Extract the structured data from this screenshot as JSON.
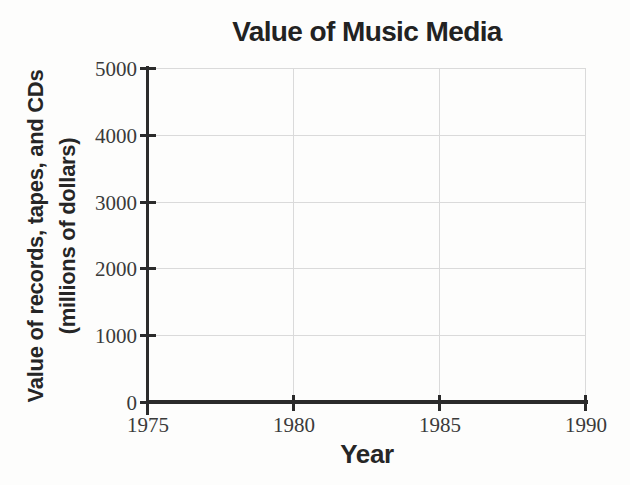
{
  "chart_data": {
    "type": "line",
    "title": "Value of Music Media",
    "xlabel": "Year",
    "ylabel": "Value of records, tapes, and CDs (millions of dollars)",
    "ylabel_lines": [
      "Value of records, tapes, and CDs",
      "(millions of dollars)"
    ],
    "xlim": [
      1975,
      1990
    ],
    "ylim": [
      0,
      5000
    ],
    "xticks": [
      1975,
      1980,
      1985,
      1990
    ],
    "yticks": [
      0,
      1000,
      2000,
      3000,
      4000,
      5000
    ],
    "grid": true,
    "series": []
  },
  "colors": {
    "axis": "#2b2b2b",
    "grid": "#dadada",
    "tick_text": "#3a3a3a",
    "label_text": "#262626",
    "background": "#fdfdfc"
  }
}
